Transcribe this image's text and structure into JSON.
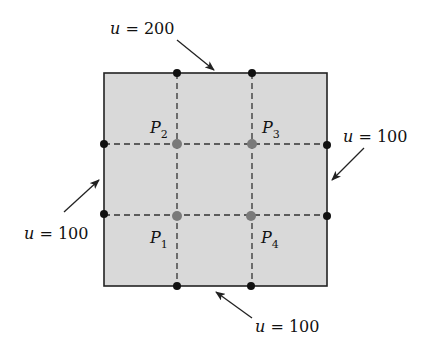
{
  "diagram": {
    "square": {
      "fill": "#d9d9d9",
      "stroke": "#222222"
    },
    "interior_points": [
      {
        "name": "P",
        "sub": "1",
        "x": 177,
        "y": 216
      },
      {
        "name": "P",
        "sub": "2",
        "x": 177,
        "y": 144
      },
      {
        "name": "P",
        "sub": "3",
        "x": 252,
        "y": 144
      },
      {
        "name": "P",
        "sub": "4",
        "x": 252,
        "y": 216
      }
    ],
    "boundary_labels": {
      "top": {
        "var": "u",
        "eq": " = ",
        "value": "200"
      },
      "right": {
        "var": "u",
        "eq": " = ",
        "value": "100"
      },
      "left": {
        "var": "u",
        "eq": " = ",
        "value": "100"
      },
      "bottom": {
        "var": "u",
        "eq": " = ",
        "value": "100"
      }
    },
    "colors": {
      "interior_dot": "#7a7a7a",
      "boundary_dot": "#111111",
      "grid_dash": "#333333"
    }
  }
}
